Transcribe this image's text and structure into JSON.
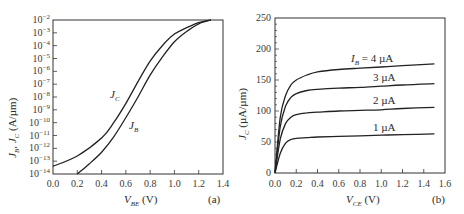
{
  "chart_data": [
    {
      "panel": "(a)",
      "type": "line",
      "xlabel": "V_BE (V)",
      "ylabel": "J_B, J_C (A/µm)",
      "yscale": "log",
      "xlim": [
        0.0,
        1.4
      ],
      "ylim": [
        1e-14,
        0.01
      ],
      "xticks": [
        "0.0",
        "0.2",
        "0.4",
        "0.6",
        "0.8",
        "1.0",
        "1.2",
        "1.4"
      ],
      "yticks": [
        "10^-2",
        "10^-3",
        "10^-4",
        "10^-5",
        "10^-6",
        "10^-7",
        "10^-8",
        "10^-9",
        "10^-10",
        "10^-11",
        "10^-12",
        "10^-13",
        "10^-14"
      ],
      "grid": false,
      "series": [
        {
          "name": "J_C",
          "x": [
            0.0,
            0.2,
            0.4,
            0.5,
            0.6,
            0.7,
            0.8,
            0.9,
            1.0,
            1.1,
            1.2,
            1.3
          ],
          "log10_y": [
            -13.4,
            -12.6,
            -11.2,
            -10.0,
            -8.5,
            -6.8,
            -5.2,
            -4.0,
            -3.1,
            -2.6,
            -2.2,
            -2.0
          ]
        },
        {
          "name": "J_B",
          "x": [
            0.2,
            0.3,
            0.4,
            0.5,
            0.6,
            0.7,
            0.8,
            0.9,
            1.0,
            1.1,
            1.2,
            1.3
          ],
          "log10_y": [
            -14.0,
            -13.2,
            -12.3,
            -11.1,
            -9.6,
            -8.0,
            -6.3,
            -4.9,
            -3.7,
            -2.9,
            -2.3,
            -2.0
          ]
        }
      ],
      "annotations": [
        "J_C",
        "J_B"
      ]
    },
    {
      "panel": "(b)",
      "type": "line",
      "xlabel": "V_CE (V)",
      "ylabel": "J_C (µA/µm)",
      "xlim": [
        0.0,
        1.6
      ],
      "ylim": [
        0,
        250
      ],
      "xticks": [
        "0.0",
        "0.2",
        "0.4",
        "0.6",
        "0.8",
        "1.0",
        "1.2",
        "1.4",
        "1.6"
      ],
      "yticks": [
        "0",
        "50",
        "100",
        "150",
        "200",
        "250"
      ],
      "grid": false,
      "series": [
        {
          "name": "I_B = 4 µA",
          "x": [
            0.0,
            0.05,
            0.1,
            0.15,
            0.2,
            0.3,
            0.4,
            0.6,
            0.8,
            1.0,
            1.2,
            1.5
          ],
          "values": [
            0,
            90,
            125,
            142,
            150,
            158,
            163,
            167,
            169,
            171,
            173,
            176
          ]
        },
        {
          "name": "3 µA",
          "x": [
            0.0,
            0.05,
            0.1,
            0.15,
            0.2,
            0.3,
            0.4,
            0.6,
            0.8,
            1.0,
            1.2,
            1.5
          ],
          "values": [
            0,
            75,
            108,
            122,
            128,
            133,
            135,
            137,
            138,
            140,
            142,
            144
          ]
        },
        {
          "name": "2 µA",
          "x": [
            0.0,
            0.05,
            0.1,
            0.15,
            0.2,
            0.3,
            0.4,
            0.6,
            0.8,
            1.0,
            1.2,
            1.5
          ],
          "values": [
            0,
            55,
            80,
            90,
            94,
            97,
            98,
            100,
            101,
            102,
            104,
            106
          ]
        },
        {
          "name": "1 µA",
          "x": [
            0.0,
            0.05,
            0.1,
            0.15,
            0.2,
            0.3,
            0.4,
            0.6,
            0.8,
            1.0,
            1.2,
            1.5
          ],
          "values": [
            0,
            32,
            48,
            54,
            56,
            57,
            58,
            59,
            60,
            61,
            62,
            63
          ]
        }
      ]
    }
  ],
  "panel_a": {
    "tag": "(a)",
    "xlabel_main": "V",
    "xlabel_sub": "BE",
    "xlabel_unit": " (V)",
    "ylabel": "J_B, J_C (A/µm)",
    "curve_labels": {
      "jc": "C",
      "jb": "B",
      "j": "J"
    }
  },
  "panel_b": {
    "tag": "(b)",
    "xlabel_main": "V",
    "xlabel_sub": "CE",
    "xlabel_unit": " (V)",
    "ylabel_main": "J",
    "ylabel_sub": "C",
    "ylabel_unit": " (µA/µm)",
    "curve_labels": {
      "ib4_main": "I",
      "ib4_sub": "B",
      "ib4_rest": " = 4 µA",
      "ib3": "3 µA",
      "ib2": "2 µA",
      "ib1": "1 µA"
    }
  }
}
